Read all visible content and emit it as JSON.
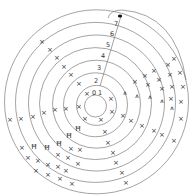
{
  "diagram": {
    "center": [
      96,
      106
    ],
    "ring_radii": [
      11,
      20,
      32,
      44,
      56,
      68,
      80,
      92
    ],
    "turn_labels": [
      {
        "text": "0",
        "x": 94,
        "y": 95
      },
      {
        "text": "1",
        "x": 100,
        "y": 95
      },
      {
        "text": "2",
        "x": 96,
        "y": 83
      },
      {
        "text": "3",
        "x": 99,
        "y": 70
      },
      {
        "text": "4",
        "x": 103,
        "y": 58
      },
      {
        "text": "5",
        "x": 108,
        "y": 47
      },
      {
        "text": "6",
        "x": 112,
        "y": 36
      },
      {
        "text": "7",
        "x": 116,
        "y": 26
      }
    ],
    "marker_dot": {
      "x": 120,
      "y": 16
    },
    "marks": [
      {
        "s": "×",
        "x": 42,
        "y": 41
      },
      {
        "s": "×",
        "x": 50,
        "y": 49
      },
      {
        "s": "×",
        "x": 57,
        "y": 57
      },
      {
        "s": "×",
        "x": 64,
        "y": 66
      },
      {
        "s": "×",
        "x": 71,
        "y": 74
      },
      {
        "s": "×",
        "x": 79,
        "y": 83
      },
      {
        "s": "×",
        "x": 87,
        "y": 93
      },
      {
        "s": "×",
        "x": 10,
        "y": 119
      },
      {
        "s": "×",
        "x": 21,
        "y": 118
      },
      {
        "s": "×",
        "x": 33,
        "y": 116
      },
      {
        "s": "×",
        "x": 44,
        "y": 112
      },
      {
        "s": "×",
        "x": 55,
        "y": 109
      },
      {
        "s": "×",
        "x": 66,
        "y": 108
      },
      {
        "s": "×",
        "x": 79,
        "y": 106
      },
      {
        "s": "×",
        "x": 85,
        "y": 118
      },
      {
        "s": "×",
        "x": 101,
        "y": 119
      },
      {
        "s": "×",
        "x": 111,
        "y": 98
      },
      {
        "s": "×",
        "x": 112,
        "y": 111
      },
      {
        "s": "×",
        "x": 123,
        "y": 115
      },
      {
        "s": "×",
        "x": 131,
        "y": 120
      },
      {
        "s": "×",
        "x": 142,
        "y": 125
      },
      {
        "s": "×",
        "x": 154,
        "y": 130
      },
      {
        "s": "×",
        "x": 162,
        "y": 134
      },
      {
        "s": "×",
        "x": 174,
        "y": 140
      },
      {
        "s": "×",
        "x": 135,
        "y": 81
      },
      {
        "s": "×",
        "x": 145,
        "y": 75
      },
      {
        "s": "×",
        "x": 148,
        "y": 84
      },
      {
        "s": "×",
        "x": 154,
        "y": 70
      },
      {
        "s": "×",
        "x": 159,
        "y": 79
      },
      {
        "s": "×",
        "x": 162,
        "y": 88
      },
      {
        "s": "×",
        "x": 168,
        "y": 64
      },
      {
        "s": "×",
        "x": 170,
        "y": 74
      },
      {
        "s": "×",
        "x": 172,
        "y": 86
      },
      {
        "s": "×",
        "x": 174,
        "y": 58
      },
      {
        "s": "×",
        "x": 180,
        "y": 72
      },
      {
        "s": "×",
        "x": 183,
        "y": 86
      },
      {
        "s": "×",
        "x": 181,
        "y": 101
      },
      {
        "s": "×",
        "x": 181,
        "y": 118
      },
      {
        "s": "×",
        "x": 171,
        "y": 98
      },
      {
        "s": "⩚",
        "x": 125,
        "y": 92
      },
      {
        "s": "⩚",
        "x": 137,
        "y": 95
      },
      {
        "s": "⩚",
        "x": 150,
        "y": 96
      },
      {
        "s": "⩚",
        "x": 162,
        "y": 100
      },
      {
        "s": "⩚",
        "x": 172,
        "y": 107
      },
      {
        "s": "×",
        "x": 105,
        "y": 131
      },
      {
        "s": "×",
        "x": 108,
        "y": 142
      },
      {
        "s": "×",
        "x": 113,
        "y": 152
      },
      {
        "s": "×",
        "x": 116,
        "y": 162
      },
      {
        "s": "×",
        "x": 122,
        "y": 172
      },
      {
        "s": "×",
        "x": 126,
        "y": 182
      },
      {
        "s": "Ħ",
        "x": 78,
        "y": 128
      },
      {
        "s": "Ħ",
        "x": 69,
        "y": 135
      },
      {
        "s": "Ħ",
        "x": 59,
        "y": 143
      },
      {
        "s": "Ħ",
        "x": 47,
        "y": 147
      },
      {
        "s": "Ħ",
        "x": 34,
        "y": 146
      },
      {
        "s": "×",
        "x": 71,
        "y": 148
      },
      {
        "s": "×",
        "x": 80,
        "y": 149
      },
      {
        "s": "×",
        "x": 58,
        "y": 154
      },
      {
        "s": "×",
        "x": 68,
        "y": 157
      },
      {
        "s": "×",
        "x": 78,
        "y": 163
      },
      {
        "s": "×",
        "x": 22,
        "y": 147
      },
      {
        "s": "×",
        "x": 28,
        "y": 157
      },
      {
        "s": "×",
        "x": 38,
        "y": 160
      },
      {
        "s": "×",
        "x": 48,
        "y": 164
      },
      {
        "s": "×",
        "x": 58,
        "y": 166
      },
      {
        "s": "×",
        "x": 66,
        "y": 170
      },
      {
        "s": "×",
        "x": 36,
        "y": 170
      },
      {
        "s": "×",
        "x": 48,
        "y": 174
      },
      {
        "s": "×",
        "x": 60,
        "y": 178
      },
      {
        "s": "×",
        "x": 72,
        "y": 183
      }
    ]
  }
}
